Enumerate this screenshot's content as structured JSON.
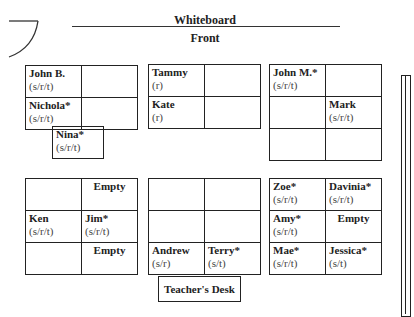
{
  "header": {
    "whiteboard_label": "Whiteboard",
    "front_label": "Front"
  },
  "groups": [
    {
      "cells": [
        [
          {
            "name": "John B.",
            "services": "(s/r/t)"
          },
          {
            "name": "",
            "services": ""
          }
        ],
        [
          {
            "name": "Nichola*",
            "services": "(s/r/t)"
          },
          {
            "name": "",
            "services": ""
          }
        ]
      ]
    },
    {
      "cells": [
        [
          {
            "name": "Tammy",
            "services": "(r)"
          },
          {
            "name": "",
            "services": ""
          }
        ],
        [
          {
            "name": "Kate",
            "services": "(r)"
          },
          {
            "name": "",
            "services": ""
          }
        ]
      ]
    },
    {
      "cells": [
        [
          {
            "name": "John M.*",
            "services": "(s/r/t)"
          },
          {
            "name": "",
            "services": ""
          }
        ],
        [
          {
            "name": "",
            "services": ""
          },
          {
            "name": "Mark",
            "services": "(s/r/t)"
          }
        ],
        [
          {
            "name": "",
            "services": ""
          },
          {
            "name": "",
            "services": ""
          }
        ]
      ]
    },
    {
      "cells": [
        [
          {
            "name": "",
            "services": ""
          },
          {
            "name": "Empty",
            "services": ""
          }
        ],
        [
          {
            "name": "Ken",
            "services": "(s/r/t)"
          },
          {
            "name": "Jim*",
            "services": "(s/r/t)"
          }
        ],
        [
          {
            "name": "",
            "services": ""
          },
          {
            "name": "Empty",
            "services": ""
          }
        ]
      ]
    },
    {
      "cells": [
        [
          {
            "name": "",
            "services": ""
          },
          {
            "name": "",
            "services": ""
          }
        ],
        [
          {
            "name": "",
            "services": ""
          },
          {
            "name": "",
            "services": ""
          }
        ],
        [
          {
            "name": "Andrew",
            "services": "(s/r)"
          },
          {
            "name": "Terry*",
            "services": "(s/t)"
          }
        ]
      ]
    },
    {
      "cells": [
        [
          {
            "name": "Zoe*",
            "services": "(s/r/t)"
          },
          {
            "name": "Davinia*",
            "services": "(s/r/t)"
          }
        ],
        [
          {
            "name": "Amy*",
            "services": "(s/r/t)"
          },
          {
            "name": "Empty",
            "services": ""
          }
        ],
        [
          {
            "name": "Mae*",
            "services": "(s/r/t)"
          },
          {
            "name": "Jessica*",
            "services": "(s/t)"
          }
        ]
      ]
    }
  ],
  "extra_seat": {
    "name": "Nina*",
    "services": "(s/r/t)"
  },
  "teacher_desk": {
    "label": "Teacher's Desk"
  }
}
